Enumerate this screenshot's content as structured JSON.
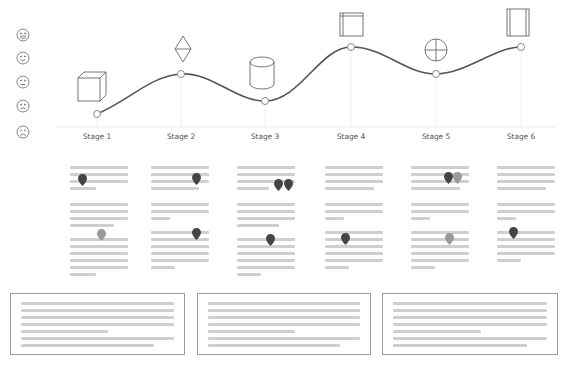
{
  "diagram": {
    "type": "customer-journey-map",
    "stages": [
      {
        "label": "Stage 1",
        "icon": "cube-icon",
        "x": 97,
        "y": 114,
        "sentiment": 2
      },
      {
        "label": "Stage 2",
        "icon": "diamond-icon",
        "x": 181,
        "y": 74,
        "sentiment": 4
      },
      {
        "label": "Stage 3",
        "icon": "cylinder-icon",
        "x": 265,
        "y": 101,
        "sentiment": 3
      },
      {
        "label": "Stage 4",
        "icon": "window-icon",
        "x": 351,
        "y": 47,
        "sentiment": 5
      },
      {
        "label": "Stage 5",
        "icon": "crosshair-circle-icon",
        "x": 436,
        "y": 74,
        "sentiment": 4
      },
      {
        "label": "Stage 6",
        "icon": "panel-icon",
        "x": 521,
        "y": 47,
        "sentiment": 5
      }
    ],
    "sentiment_scale": [
      {
        "icon": "very-happy-face-icon",
        "level": 5
      },
      {
        "icon": "happy-face-icon",
        "level": 4
      },
      {
        "icon": "neutral-face-icon",
        "level": 3
      },
      {
        "icon": "sad-face-icon",
        "level": 2
      },
      {
        "icon": "very-sad-face-icon",
        "level": 1
      }
    ],
    "colors": {
      "curve": "#555555",
      "axis": "#e6e6e6",
      "text_placeholder": "#cfcfcf",
      "pin_dark": "#444444",
      "pin_light": "#9a9a9a",
      "box_border": "#9a9a9a",
      "label": "#555555"
    },
    "columns": [
      {
        "pins": [
          {
            "x": 8,
            "y": 10,
            "tone": "dark"
          },
          {
            "x": 27,
            "y": 65,
            "tone": "light"
          }
        ]
      },
      {
        "pins": [
          {
            "x": 41,
            "y": 9,
            "tone": "dark"
          },
          {
            "x": 41,
            "y": 64,
            "tone": "dark"
          }
        ]
      },
      {
        "pins": [
          {
            "x": 37,
            "y": 15,
            "tone": "dark"
          },
          {
            "x": 47,
            "y": 15,
            "tone": "dark"
          },
          {
            "x": 29,
            "y": 70,
            "tone": "dark"
          }
        ]
      },
      {
        "pins": [
          {
            "x": 16,
            "y": 69,
            "tone": "dark"
          }
        ]
      },
      {
        "pins": [
          {
            "x": 33,
            "y": 8,
            "tone": "dark"
          },
          {
            "x": 42,
            "y": 8,
            "tone": "light"
          },
          {
            "x": 34,
            "y": 69,
            "tone": "light"
          }
        ]
      },
      {
        "pins": [
          {
            "x": 12,
            "y": 63,
            "tone": "dark"
          }
        ]
      }
    ],
    "bottom_boxes": 3
  }
}
